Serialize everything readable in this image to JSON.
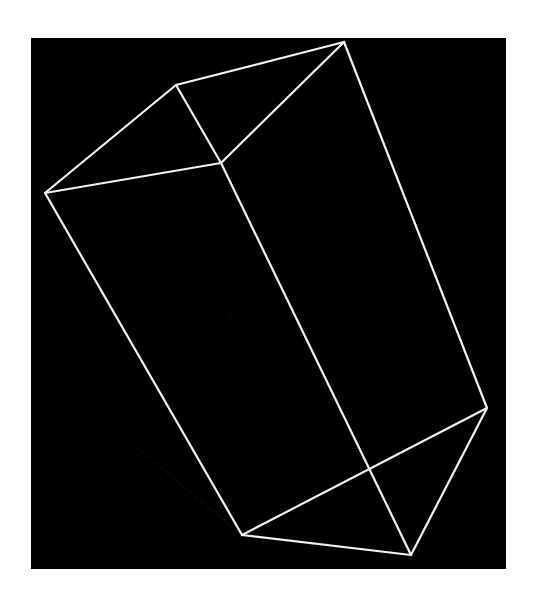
{
  "figure": {
    "kind": "volume-rendering",
    "canvas": {
      "background_color": "#000000",
      "page_background_color": "#ffffff",
      "x": 31,
      "y": 38,
      "width": 475,
      "height": 531
    },
    "wireframe": {
      "name": "domain-bounding-box",
      "stroke_color": "#f2f2f2",
      "stroke_width": 2.2,
      "vertices": {
        "top_back_left": [
          145,
          47
        ],
        "top_apex": [
          313,
          4
        ],
        "top_front_left": [
          14,
          155
        ],
        "top_front_right": [
          190,
          125
        ],
        "right_far": [
          456,
          370
        ],
        "bottom_apex": [
          380,
          517
        ],
        "bottom_front_left": [
          211,
          497
        ],
        "bottom_hidden": [
          104,
          408
        ]
      },
      "edges": [
        [
          "top_front_left",
          "top_back_left"
        ],
        [
          "top_back_left",
          "top_apex"
        ],
        [
          "top_apex",
          "top_front_right"
        ],
        [
          "top_front_right",
          "top_front_left"
        ],
        [
          "top_back_left",
          "top_front_right"
        ],
        [
          "top_apex",
          "right_far"
        ],
        [
          "right_far",
          "bottom_apex"
        ],
        [
          "bottom_apex",
          "bottom_front_left"
        ],
        [
          "bottom_front_left",
          "top_front_left"
        ],
        [
          "top_front_right",
          "bottom_front_left"
        ],
        [
          "right_far",
          "bottom_front_left"
        ]
      ]
    },
    "volume": {
      "name": "scalar-field-mixing-region",
      "colormap": "grayscale",
      "intensity_low_color": "#000000",
      "intensity_mid_color": "#8a8a8a",
      "intensity_high_color": "#f5f2ea",
      "description_regions": [
        {
          "label": "upper-unmixed-dark-region",
          "relative_intensity": 0.18
        },
        {
          "label": "mid-transition-region",
          "relative_intensity": 0.55
        },
        {
          "label": "lower-bright-mixed-region",
          "relative_intensity": 0.92
        }
      ]
    }
  },
  "chart_data": {
    "type": "heatmap",
    "title": "",
    "xlabel": "",
    "ylabel": "",
    "grid": false,
    "legend_position": "none",
    "intensity_profile": {
      "axis": "vertical (domain height, top = 1.0, bottom = 0.0)",
      "normalized_depth": [
        1.0,
        0.9,
        0.8,
        0.7,
        0.6,
        0.5,
        0.4,
        0.3,
        0.2,
        0.1,
        0.0
      ],
      "mean_intensity": [
        0.04,
        0.08,
        0.14,
        0.2,
        0.28,
        0.42,
        0.6,
        0.78,
        0.88,
        0.82,
        0.45
      ]
    }
  }
}
